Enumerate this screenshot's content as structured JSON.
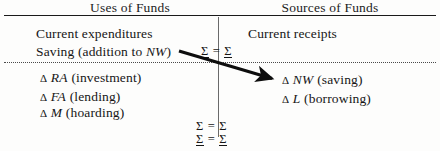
{
  "diagram": {
    "title_left": "Uses of Funds",
    "title_right": "Sources of Funds",
    "left_column": {
      "current_label": "Current expenditures",
      "saving_label_prefix": "Saving (addition to ",
      "saving_label_symbol": "NW",
      "saving_label_suffix": ")",
      "items": [
        {
          "delta": "Δ",
          "symbol": "RA",
          "note": "(investment)"
        },
        {
          "delta": "Δ",
          "symbol": "FA",
          "note": "(lending)"
        },
        {
          "delta": "Δ",
          "symbol": "M",
          "note": "(hoarding)"
        }
      ]
    },
    "right_column": {
      "current_label": "Current receipts",
      "items": [
        {
          "delta": "Δ",
          "symbol": "NW",
          "note": "(saving)"
        },
        {
          "delta": "Δ",
          "symbol": "L",
          "note": "(borrowing)"
        }
      ]
    },
    "sigma_rows": [
      {
        "id": "top",
        "left": "Σ",
        "relation": "=",
        "right": "Σ",
        "underlined": true,
        "crossed": true
      },
      {
        "id": "bottom-1",
        "left": "Σ",
        "relation": "=",
        "right": "Σ",
        "underlined": false,
        "crossed": true
      },
      {
        "id": "bottom-2",
        "left": "Σ",
        "relation": "=",
        "right": "Σ",
        "underlined": true,
        "crossed": false
      }
    ],
    "arrow": {
      "name": "saving-to-delta-nw-arrow",
      "from_x": 179,
      "from_y": 51,
      "to_x": 277,
      "to_y": 80
    },
    "colors": {
      "ink": "#161616",
      "rule": "#1a1a1a",
      "dotted_rule": "#4a4a4a",
      "divider": "#6a6a6a",
      "background": "#fdfdfc"
    }
  }
}
